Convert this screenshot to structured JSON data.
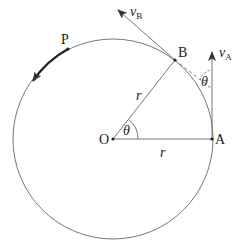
{
  "diagram": {
    "type": "circular-motion",
    "circle": {
      "cx": 113,
      "cy": 139,
      "r": 100
    },
    "points": {
      "O": {
        "label": "O",
        "x": 113,
        "y": 139
      },
      "A": {
        "label": "A",
        "x": 212,
        "y": 139
      },
      "B": {
        "label": "B",
        "x": 175,
        "y": 60
      },
      "P": {
        "label": "P",
        "x": 68,
        "y": 49
      }
    },
    "labels": {
      "radius_OB": "r",
      "radius_OA": "r",
      "angle_O": "θ",
      "angle_between_velocities": "θ",
      "vB_main": "v",
      "vB_sub": "B",
      "vA_main": "v",
      "vA_sub": "A"
    },
    "colors": {
      "line": "#777777",
      "dark": "#222222"
    }
  }
}
